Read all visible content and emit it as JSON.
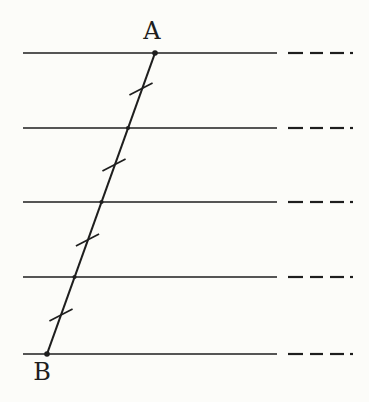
{
  "figure": {
    "background_color": "#fcfcf9",
    "ink_color": "#1e1e1e",
    "canvas": {
      "width": 369,
      "height": 402
    },
    "parallel_lines": {
      "ys": [
        53,
        128,
        202,
        277,
        354
      ],
      "solid_x": [
        23,
        277
      ],
      "dash_segments_x": [
        [
          288,
          303
        ],
        [
          310,
          323
        ],
        [
          330,
          344
        ],
        [
          350,
          353
        ]
      ],
      "stroke_width": 1.7,
      "dash_stroke_width": 2.2
    },
    "transversal": {
      "x1": 155,
      "y1": 53,
      "x2": 47,
      "y2": 354,
      "stroke_width": 2.1
    },
    "tick_marks": {
      "centers": [
        [
          141,
          89
        ],
        [
          114,
          165
        ],
        [
          87.5,
          240
        ],
        [
          61,
          315
        ]
      ],
      "length": 26,
      "angle_deg": -27,
      "stroke_width": 1.7
    },
    "dots": {
      "endpoint_radius": 2.8,
      "intersection_radius": 2.1,
      "endpoints": [
        [
          155,
          53
        ],
        [
          47,
          354
        ]
      ],
      "intersections": [
        [
          128,
          128
        ],
        [
          101.5,
          202
        ],
        [
          74.5,
          277
        ]
      ]
    },
    "labels": [
      {
        "text": "A",
        "x": 152,
        "y": 31
      },
      {
        "text": "B",
        "x": 42,
        "y": 372
      }
    ]
  }
}
